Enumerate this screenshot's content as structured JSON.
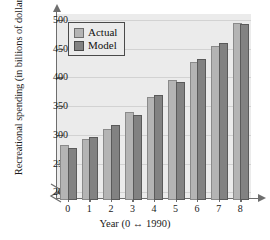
{
  "chart_data": {
    "type": "bar",
    "title": "",
    "xlabel": "Year (0 ↔ 1990)",
    "ylabel": "Recreational spending (in billions of dollars)",
    "categories": [
      "0",
      "1",
      "2",
      "3",
      "4",
      "5",
      "6",
      "7",
      "8"
    ],
    "yticks": [
      200,
      250,
      300,
      350,
      400,
      450,
      500
    ],
    "ylim": [
      190,
      510
    ],
    "axis_break": true,
    "grid": true,
    "legend_position": "top-left",
    "series": [
      {
        "name": "Actual",
        "color": "#b4b4b4",
        "values": [
          283,
          292,
          310,
          340,
          365,
          396,
          427,
          455,
          495
        ]
      },
      {
        "name": "Model",
        "color": "#828282",
        "values": [
          277,
          296,
          317,
          334,
          370,
          391,
          431,
          459,
          492
        ]
      }
    ]
  }
}
